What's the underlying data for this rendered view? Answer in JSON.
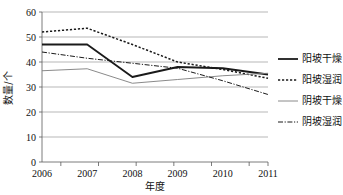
{
  "chart_data": {
    "type": "line",
    "title": "",
    "xlabel": "年度",
    "ylabel": "数量/个",
    "categories": [
      "2006",
      "2007",
      "2008",
      "2009",
      "2010",
      "2011"
    ],
    "x": [
      2006,
      2007,
      2008,
      2009,
      2010,
      2011
    ],
    "ylim": [
      0,
      60
    ],
    "ytick_values": [
      0,
      10,
      20,
      30,
      40,
      50,
      60
    ],
    "ytick_labels": [
      "0",
      "10",
      "20",
      "30",
      "40",
      "50",
      "60"
    ],
    "grid": "horizontal",
    "legend_position": "right",
    "series": [
      {
        "name": "阳坡干燥",
        "values": [
          47,
          47,
          34,
          38,
          37.5,
          35
        ],
        "style": "solid-thick",
        "color": "#1a1a1a",
        "width": 1.8,
        "dash": ""
      },
      {
        "name": "阳坡湿润",
        "values": [
          52,
          53.5,
          47,
          40,
          37,
          33.5
        ],
        "style": "dotted",
        "color": "#1a1a1a",
        "width": 1.5,
        "dash": "2.2,1.8"
      },
      {
        "name": "阴坡干燥",
        "values": [
          36.5,
          37.3,
          31.5,
          33,
          34.5,
          35.5
        ],
        "style": "solid-thin",
        "color": "#7d7d7d",
        "width": 0.9,
        "dash": ""
      },
      {
        "name": "阴坡湿润",
        "values": [
          44,
          41.5,
          39.5,
          37.5,
          32.5,
          27
        ],
        "style": "dash-dot",
        "color": "#1a1a1a",
        "width": 1.0,
        "dash": "5,1.6,1.2,1.6"
      }
    ]
  },
  "axes": {
    "ylabel_text": "数量/个",
    "xlabel_text": "年度"
  },
  "legend": {
    "items": [
      {
        "label": "阳坡干燥"
      },
      {
        "label": "阳坡湿润"
      },
      {
        "label": "阴坡干燥"
      },
      {
        "label": "阴坡湿润"
      }
    ]
  },
  "colors": {
    "gridline": "#9a9a9a",
    "axis": "#5a5a5a",
    "primary": "#1a1a1a",
    "secondary": "#7d7d7d",
    "background": "#ffffff"
  }
}
